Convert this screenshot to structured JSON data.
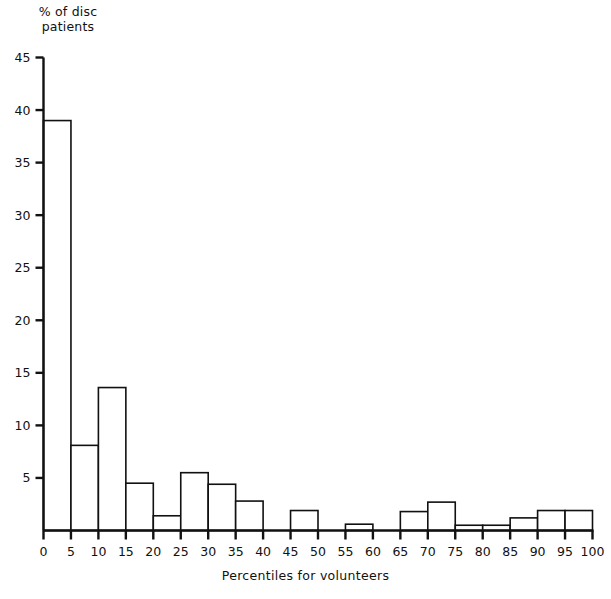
{
  "chart_data": {
    "type": "bar",
    "title": "",
    "ylabel": "% of disc\npatients",
    "xlabel": "Percentiles for volunteers",
    "grid": false,
    "legend": "none",
    "xlim": [
      0,
      100
    ],
    "ylim": [
      0,
      45
    ],
    "x_tick_labels": [
      "0",
      "5",
      "10",
      "15",
      "20",
      "25",
      "30",
      "35",
      "40",
      "45",
      "50",
      "55",
      "60",
      "65",
      "70",
      "75",
      "80",
      "85",
      "90",
      "95",
      "100"
    ],
    "y_tick_labels": [
      "0",
      "5",
      "10",
      "15",
      "20",
      "25",
      "30",
      "35",
      "40",
      "45"
    ],
    "y_ticks": [
      0,
      5,
      10,
      15,
      20,
      25,
      30,
      35,
      40,
      45
    ],
    "bin_width": 5,
    "bin_edges": [
      0,
      5,
      10,
      15,
      20,
      25,
      30,
      35,
      40,
      45,
      50,
      55,
      60,
      65,
      70,
      75,
      80,
      85,
      90,
      95,
      100
    ],
    "categories": [
      "0-5",
      "5-10",
      "10-15",
      "15-20",
      "20-25",
      "25-30",
      "30-35",
      "35-40",
      "40-45",
      "45-50",
      "50-55",
      "55-60",
      "60-65",
      "65-70",
      "70-75",
      "75-80",
      "80-85",
      "85-90",
      "90-95",
      "95-100"
    ],
    "values": [
      39.0,
      8.1,
      13.6,
      4.5,
      1.4,
      5.5,
      4.4,
      2.8,
      0.0,
      1.9,
      0.0,
      0.6,
      0.0,
      1.8,
      2.7,
      0.5,
      0.5,
      1.2,
      1.9,
      1.9
    ]
  },
  "style": {
    "line_color": "#111111",
    "bar_fill": "#ffffff",
    "background": "#ffffff"
  }
}
